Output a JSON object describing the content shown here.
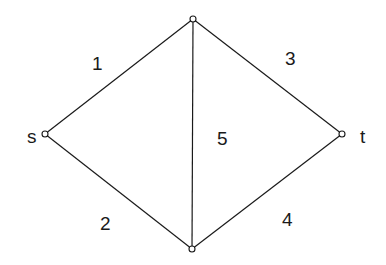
{
  "diagram": {
    "type": "flow-network",
    "nodes": [
      {
        "id": "s",
        "label": "s",
        "x": 45,
        "y": 134,
        "lx": 27,
        "ly": 143
      },
      {
        "id": "top",
        "label": "",
        "x": 193,
        "y": 19
      },
      {
        "id": "t",
        "label": "t",
        "x": 342,
        "y": 134,
        "lx": 360,
        "ly": 143
      },
      {
        "id": "bottom",
        "label": "",
        "x": 192,
        "y": 249
      }
    ],
    "edges": [
      {
        "from": "s",
        "to": "top",
        "label": "1",
        "lx": 92,
        "ly": 70
      },
      {
        "from": "s",
        "to": "bottom",
        "label": "2",
        "lx": 100,
        "ly": 230
      },
      {
        "from": "top",
        "to": "t",
        "label": "3",
        "lx": 285,
        "ly": 65
      },
      {
        "from": "bottom",
        "to": "t",
        "label": "4",
        "lx": 282,
        "ly": 226
      },
      {
        "from": "top",
        "to": "bottom",
        "label": "5",
        "lx": 217,
        "ly": 145
      }
    ]
  }
}
